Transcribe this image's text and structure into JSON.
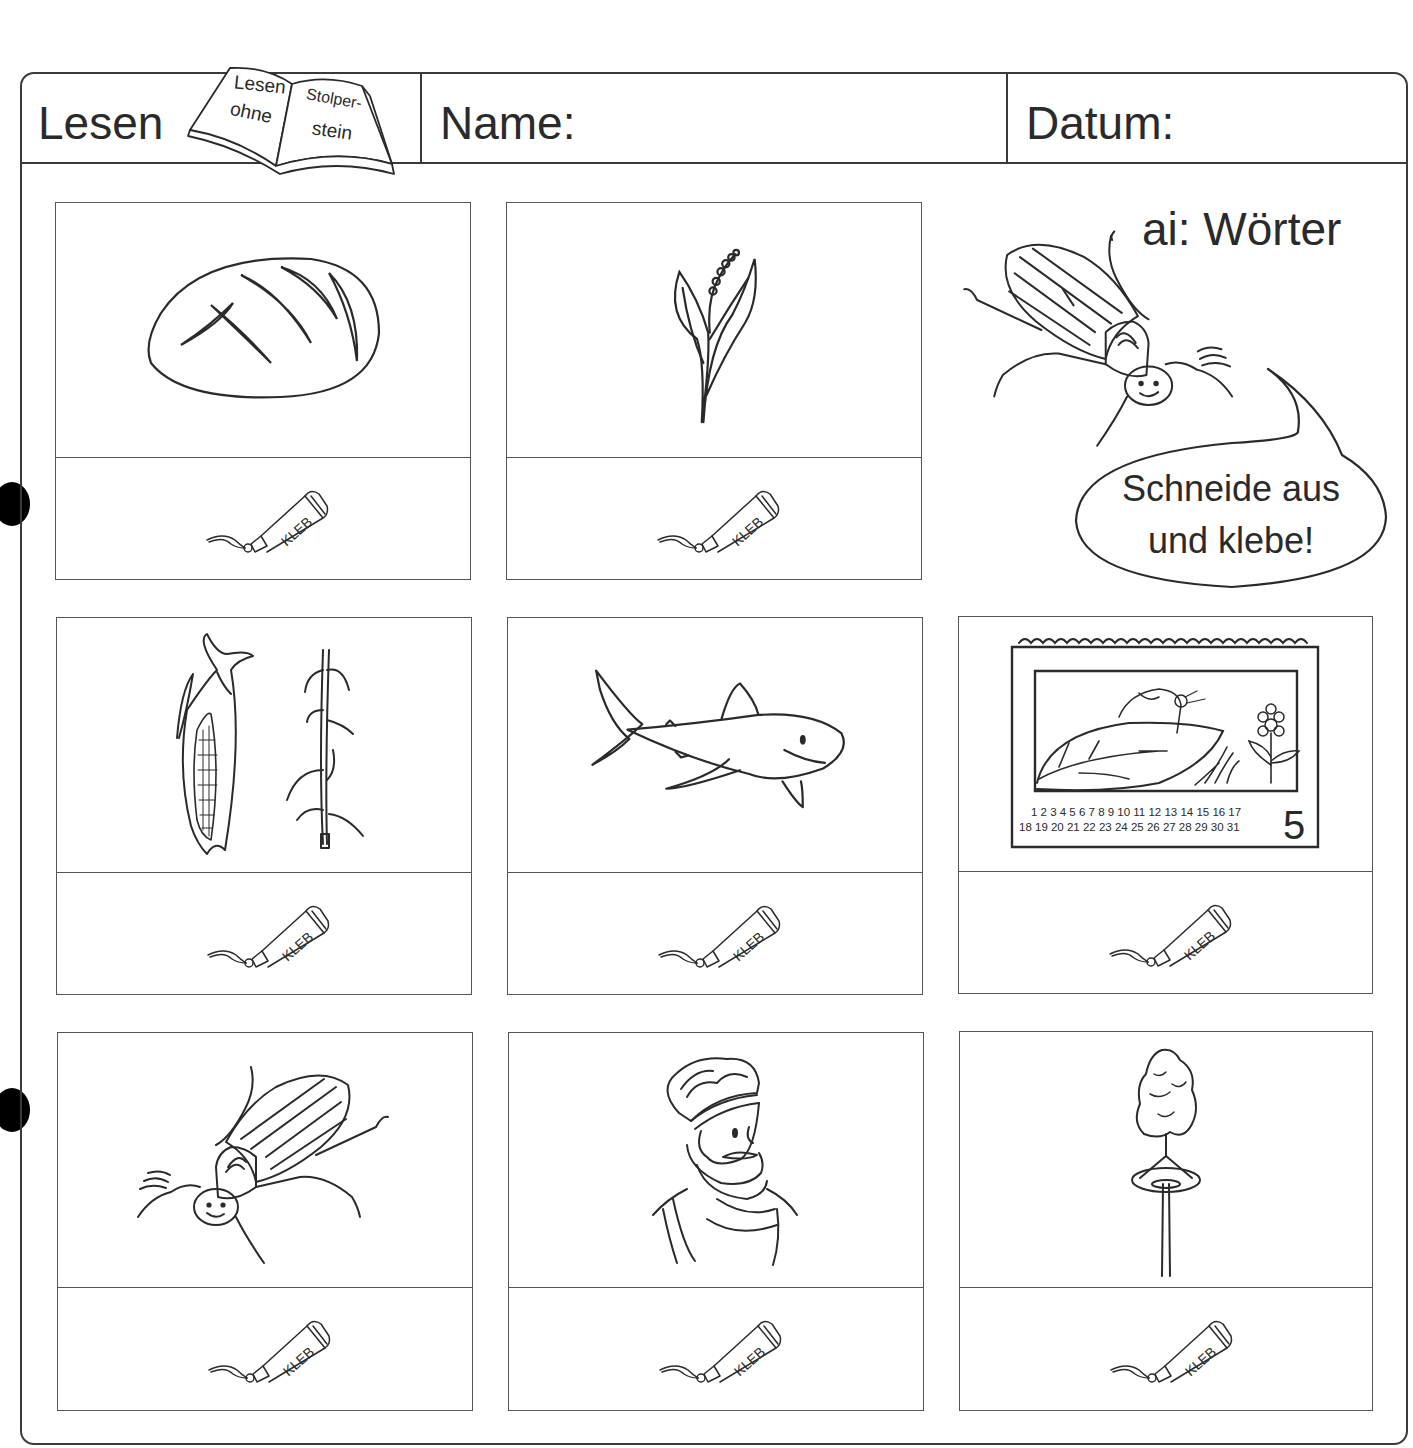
{
  "header": {
    "title": "Lesen",
    "logo": {
      "line1": "Lesen",
      "line2": "ohne",
      "line3": "Stolper-",
      "line4": "stein"
    },
    "name_label": "Name:",
    "date_label": "Datum:"
  },
  "worksheet": {
    "topic": "ai: Wörter",
    "instruction_line1": "Schneide aus",
    "instruction_line2": "und klebe!",
    "glue_label": "KLEB"
  },
  "cards": [
    {
      "row": 1,
      "col": 1,
      "picture": "bread"
    },
    {
      "row": 1,
      "col": 2,
      "picture": "lily-of-the-valley"
    },
    {
      "row": 2,
      "col": 1,
      "picture": "corn"
    },
    {
      "row": 2,
      "col": 2,
      "picture": "shark"
    },
    {
      "row": 2,
      "col": 3,
      "picture": "may-calendar"
    },
    {
      "row": 3,
      "col": 1,
      "picture": "may-beetle"
    },
    {
      "row": 3,
      "col": 2,
      "picture": "emperor"
    },
    {
      "row": 3,
      "col": 3,
      "picture": "maypole"
    }
  ],
  "calendar": {
    "days_row1": "1 2 3 4 5 6 7 8 9 10 11 12 13 14 15 16 17",
    "days_row2": "18 19 20 21 22 23 24 25 26 27 28 29 30 31",
    "month_number": "5"
  },
  "colors": {
    "ink": "#2a2a2a",
    "line": "#3a3a3a",
    "paper": "#ffffff"
  }
}
